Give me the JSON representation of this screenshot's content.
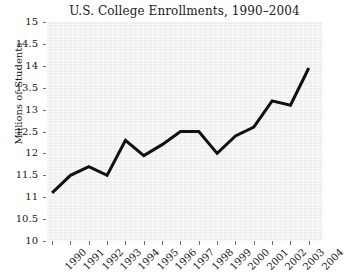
{
  "chart_data": {
    "type": "line",
    "title": "U.S. College Enrollments, 1990–2004",
    "xlabel": "",
    "ylabel": "Millions of Students",
    "categories": [
      "1990",
      "1991",
      "1992",
      "1993",
      "1994",
      "1995",
      "1996",
      "1997",
      "1998",
      "1999",
      "2000",
      "2001",
      "2002",
      "2003",
      "2004"
    ],
    "values": [
      11.1,
      11.5,
      11.7,
      11.5,
      12.3,
      11.95,
      12.2,
      12.5,
      12.5,
      12.0,
      12.4,
      12.6,
      13.2,
      13.1,
      13.95
    ],
    "series": [
      {
        "name": "Enrollment",
        "values": [
          11.1,
          11.5,
          11.7,
          11.5,
          12.3,
          11.95,
          12.2,
          12.5,
          12.5,
          12.0,
          12.4,
          12.6,
          13.2,
          13.1,
          13.95
        ]
      }
    ],
    "ylim": [
      10,
      15
    ],
    "ytick_values": [
      10,
      10.5,
      11,
      11.5,
      12,
      12.5,
      13,
      13.5,
      14,
      14.5,
      15
    ],
    "ytick_labels": [
      "10",
      "10.5",
      "11",
      "11.5",
      "12",
      "12.5",
      "13",
      "13.5",
      "14",
      "14.5",
      "15"
    ],
    "xtick_labels": [
      "1990",
      "1991",
      "1992",
      "1993",
      "1994",
      "1995",
      "1996",
      "1997",
      "1998",
      "1999",
      "2000",
      "2001",
      "2002",
      "2003",
      "2004"
    ],
    "grid": false,
    "legend": "none",
    "line_color": "#111111",
    "line_width": 3,
    "plot_background": "#f2f2f2",
    "figure_background": "#ffffff",
    "tick_color": "#6e6e6e",
    "text_color": "#1a1a1a"
  }
}
